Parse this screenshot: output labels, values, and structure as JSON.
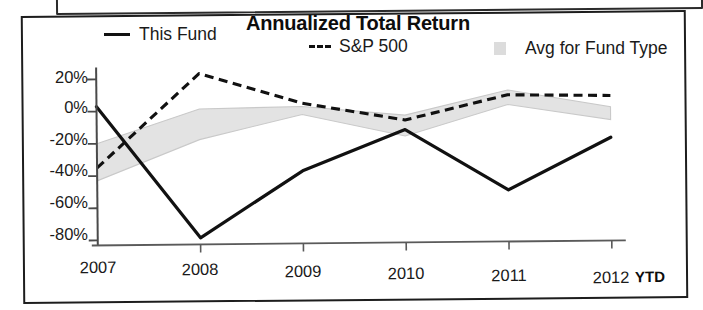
{
  "chart_title": "Annualized Total Return",
  "legend": [
    {
      "label": "This Fund",
      "marker": "solid-line-swatch"
    },
    {
      "label": "S&P 500",
      "marker": "dashed-line-swatch"
    },
    {
      "label": "Avg for Fund Type",
      "marker": "gray-box-swatch"
    }
  ],
  "axis": {
    "ytd_note": "YTD",
    "y_ticks": [
      "20%",
      "0%",
      "-20%",
      "-40%",
      "-60%",
      "-80%"
    ],
    "x_ticks": [
      "2007",
      "2008",
      "2009",
      "2010",
      "2011",
      "2012"
    ]
  },
  "colors": {
    "line": "#111111",
    "band_fill": "#e3e3e3",
    "band_edge": "#c8c8c8",
    "frame": "#1d1d1d",
    "text": "#1a1a1a"
  },
  "chart_data": {
    "type": "line",
    "title": "Annualized Total Return",
    "xlabel": "",
    "ylabel": "",
    "x": [
      "2007",
      "2008",
      "2009",
      "2010",
      "2011",
      "2012"
    ],
    "ylim": [
      -85,
      25
    ],
    "xlim": [
      "2007",
      "2012"
    ],
    "grid": false,
    "legend_position": "top",
    "y_tick_values": [
      20,
      0,
      -20,
      -40,
      -60,
      -80
    ],
    "y_tick_labels": [
      "20%",
      "0%",
      "-20%",
      "-40%",
      "-60%",
      "-80%"
    ],
    "annotations": [
      "YTD"
    ],
    "series": [
      {
        "name": "This Fund",
        "style": "solid",
        "values": [
          3,
          -79,
          -38,
          -13,
          -51,
          -19
        ]
      },
      {
        "name": "S&P 500",
        "style": "dashed",
        "values": [
          -35,
          23,
          4,
          -7,
          8,
          7
        ]
      },
      {
        "name": "Avg for Fund Type",
        "style": "band",
        "upper": [
          -20,
          1,
          2,
          -4,
          11,
          0
        ],
        "lower": [
          -43,
          -18,
          -3,
          -17,
          2,
          -8
        ]
      }
    ]
  }
}
